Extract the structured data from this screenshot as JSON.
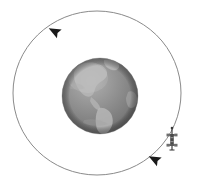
{
  "scene": {
    "title": "Satellite orbiting Earth",
    "background_color": "#ffffff",
    "width": 199,
    "height": 188
  },
  "earth": {
    "label": "Earth",
    "center_x": 100,
    "center_y": 96,
    "radius": 38,
    "ocean_color": "#8d8d8d",
    "land_color": "#b4b4b4",
    "highlight_color": "#c2c2c2",
    "shadow_color": "#5e5e5e",
    "visible_hemisphere": "Americas"
  },
  "orbit": {
    "label": "Orbit path",
    "center_x": 97,
    "center_y": 93,
    "radius_x": 84,
    "radius_y": 82,
    "stroke_color": "#8a8a8a",
    "stroke_width": 1,
    "direction": "counterclockwise",
    "dash": "none"
  },
  "arrows": [
    {
      "name": "orbit-direction-arrow-top-left",
      "x": 54,
      "y": 31,
      "angle_deg": 208,
      "size": 11,
      "color": "#1a1a1a"
    },
    {
      "name": "orbit-direction-arrow-bottom-right",
      "x": 154,
      "y": 159,
      "angle_deg": 208,
      "size": 11,
      "color": "#1a1a1a"
    }
  ],
  "satellite": {
    "label": "Satellite",
    "x": 172,
    "y": 140,
    "body_color": "#4a4a4a",
    "panel_color": "#707070",
    "antenna_color": "#2e2e2e",
    "height": 22,
    "width": 12
  }
}
